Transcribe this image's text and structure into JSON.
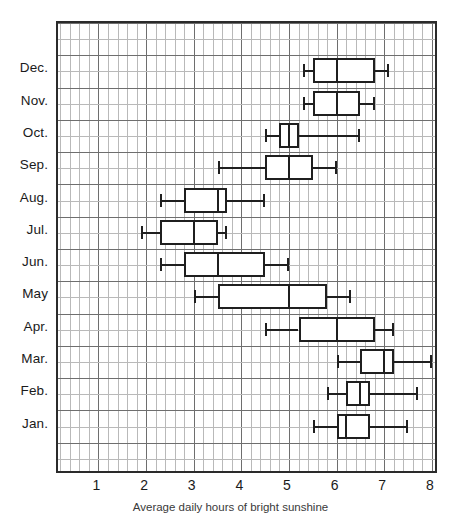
{
  "caption": "Average daily hours of bright sunshine",
  "axis": {
    "x_ticks": [
      "1",
      "2",
      "3",
      "4",
      "5",
      "6",
      "7",
      "8"
    ],
    "x_min": 0.15,
    "x_max": 8.15,
    "grid_minor_step": 0.2,
    "grid_major_step": 1.0
  },
  "chart_data": {
    "type": "box",
    "title": "",
    "xlabel": "Average daily hours of bright sunshine",
    "ylabel": "",
    "xlim": [
      0.15,
      8.15
    ],
    "grid": true,
    "legend": "none",
    "orientation": "horizontal",
    "categories": [
      "Dec.",
      "Nov.",
      "Oct.",
      "Sep.",
      "Aug.",
      "Jul.",
      "Jun.",
      "May",
      "Apr.",
      "Mar.",
      "Feb.",
      "Jan."
    ],
    "boxes": [
      {
        "category": "Dec.",
        "whisker_low": 5.3,
        "q1": 5.5,
        "median": 6.0,
        "q3": 6.8,
        "whisker_high": 7.1
      },
      {
        "category": "Nov.",
        "whisker_low": 5.3,
        "q1": 5.5,
        "median": 6.0,
        "q3": 6.5,
        "whisker_high": 6.8
      },
      {
        "category": "Oct.",
        "whisker_low": 4.5,
        "q1": 4.8,
        "median": 5.0,
        "q3": 5.2,
        "whisker_high": 6.5
      },
      {
        "category": "Sep.",
        "whisker_low": 3.5,
        "q1": 4.5,
        "median": 5.0,
        "q3": 5.5,
        "whisker_high": 6.0
      },
      {
        "category": "Aug.",
        "whisker_low": 2.3,
        "q1": 2.8,
        "median": 3.5,
        "q3": 3.7,
        "whisker_high": 4.5
      },
      {
        "category": "Jul.",
        "whisker_low": 1.9,
        "q1": 2.3,
        "median": 3.0,
        "q3": 3.5,
        "whisker_high": 3.7
      },
      {
        "category": "Jun.",
        "whisker_low": 2.3,
        "q1": 2.8,
        "median": 3.5,
        "q3": 4.5,
        "whisker_high": 5.0
      },
      {
        "category": "May",
        "whisker_low": 3.0,
        "q1": 3.5,
        "median": 5.0,
        "q3": 5.8,
        "whisker_high": 6.3
      },
      {
        "category": "Apr.",
        "whisker_low": 4.5,
        "q1": 5.2,
        "median": 6.0,
        "q3": 6.8,
        "whisker_high": 7.2
      },
      {
        "category": "Mar.",
        "whisker_low": 6.0,
        "q1": 6.5,
        "median": 7.0,
        "q3": 7.2,
        "whisker_high": 8.0
      },
      {
        "category": "Feb.",
        "whisker_low": 5.8,
        "q1": 6.2,
        "median": 6.5,
        "q3": 6.7,
        "whisker_high": 7.7
      },
      {
        "category": "Jan.",
        "whisker_low": 5.5,
        "q1": 6.0,
        "median": 6.2,
        "q3": 6.7,
        "whisker_high": 7.5
      }
    ]
  }
}
